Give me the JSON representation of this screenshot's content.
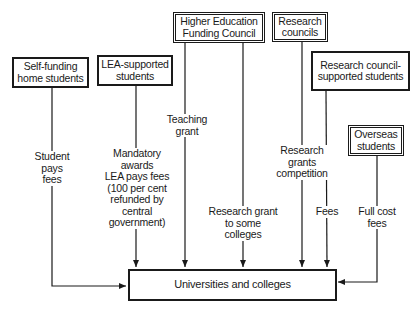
{
  "sources": {
    "self_funding": "Self-funding home students",
    "lea_supported": "LEA-supported students",
    "hefc": "Higher Education Funding Council",
    "research_councils": "Research councils",
    "rc_supported": "Research council-supported students",
    "overseas": "Overseas students"
  },
  "target": "Universities and colleges",
  "flows": {
    "student_pays": "Student\npays\nfees",
    "mandatory_awards": "Mandatory\nawards\nLEA pays fees\n(100 per cent\nrefunded by\ncentral\ngovernment)",
    "teaching_grant": "Teaching\ngrant",
    "research_grant_some": "Research grant\nto some\ncolleges",
    "research_grants_comp": "Research\ngrants\ncompetition",
    "fees": "Fees",
    "full_cost": "Full cost\nfees"
  },
  "colors": {
    "ink": "#1a1a1a",
    "background": "#ffffff"
  }
}
